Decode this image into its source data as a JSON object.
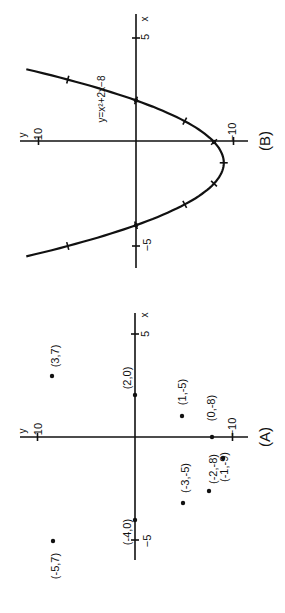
{
  "figure": {
    "rotation_deg": -90,
    "panels": [
      {
        "id": "A",
        "caption": "(A)"
      },
      {
        "id": "B",
        "caption": "(B)"
      }
    ]
  },
  "chart_data": [
    {
      "type": "scatter",
      "title": "(A)",
      "xlabel": "x",
      "ylabel": "y",
      "xticks": [
        -5,
        5
      ],
      "yticks": [
        10,
        -10
      ],
      "xlim": [
        -6,
        6
      ],
      "ylim": [
        -11,
        12
      ],
      "points": [
        {
          "x": -5,
          "y": 7,
          "label": "(-5,7)"
        },
        {
          "x": 3,
          "y": 7,
          "label": "(3,7)"
        },
        {
          "x": -4,
          "y": 0,
          "label": "(-4,0)"
        },
        {
          "x": 2,
          "y": 0,
          "label": "(2,0)"
        },
        {
          "x": -3,
          "y": -5,
          "label": "(-3,-5)"
        },
        {
          "x": 1,
          "y": -5,
          "label": "(1,-5)"
        },
        {
          "x": -2,
          "y": -8,
          "label": "(-2,-8)"
        },
        {
          "x": 0,
          "y": -8,
          "label": "(0,-8)"
        },
        {
          "x": -1,
          "y": -9,
          "label": "(-1,-9)"
        }
      ],
      "grid": false
    },
    {
      "type": "line",
      "title": "(B)",
      "xlabel": "x",
      "ylabel": "y",
      "equation": "y=x^2+2x-8",
      "curve_label": "y=x²+2x−8",
      "xticks": [
        -5,
        5
      ],
      "yticks": [
        10,
        -10
      ],
      "xlim": [
        -6,
        6
      ],
      "ylim": [
        -11,
        12
      ],
      "x": [
        -6.2,
        -5,
        -4,
        -3,
        -2,
        -1,
        0,
        1,
        2,
        3,
        4.2
      ],
      "y": [
        18.04,
        7,
        0,
        -5,
        -8,
        -9,
        -8,
        -5,
        0,
        7,
        18.04
      ],
      "marked_points": [
        {
          "x": -5,
          "y": 7
        },
        {
          "x": -4,
          "y": 0
        },
        {
          "x": -3,
          "y": -5
        },
        {
          "x": -2,
          "y": -8
        },
        {
          "x": -1,
          "y": -9
        },
        {
          "x": 0,
          "y": -8
        },
        {
          "x": 1,
          "y": -5
        },
        {
          "x": 2,
          "y": 0
        },
        {
          "x": 3,
          "y": 7
        }
      ],
      "grid": false
    }
  ],
  "labels": {
    "x_axis": "x",
    "y_axis": "y",
    "tick_x_pos": "5",
    "tick_x_neg": "−5",
    "tick_y_pos": "10",
    "tick_y_neg": "−10"
  }
}
